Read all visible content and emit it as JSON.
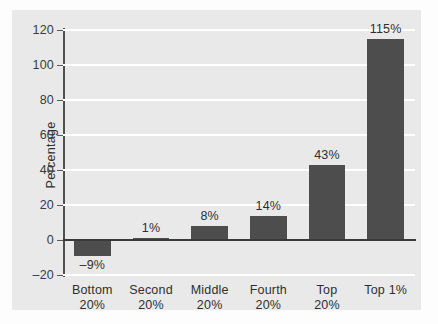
{
  "chart_data": {
    "type": "bar",
    "title": "",
    "xlabel": "",
    "ylabel": "Percentage",
    "categories": [
      "Bottom\n20%",
      "Second\n20%",
      "Middle\n20%",
      "Fourth\n20%",
      "Top\n20%",
      "Top 1%"
    ],
    "values": [
      -9,
      1,
      8,
      14,
      43,
      115
    ],
    "value_labels": [
      "–9%",
      "1%",
      "8%",
      "14%",
      "43%",
      "115%"
    ],
    "ylim": [
      -20,
      120
    ],
    "yticks": [
      120,
      100,
      80,
      60,
      40,
      20,
      0,
      -20
    ],
    "ytick_labels": [
      "120",
      "100",
      "80",
      "60",
      "40",
      "20",
      "0",
      "–20"
    ],
    "grid": "horizontal-white",
    "legend": "none",
    "colors": {
      "bar": "#4d4d4d",
      "panel_background": "#e9e9e9",
      "figure_background": "#fdfdfd",
      "gridline": "#ffffff",
      "axis_line": "#4f4f4f",
      "zero_line": "#3a3a3a",
      "text": "#2f2f2f"
    }
  }
}
